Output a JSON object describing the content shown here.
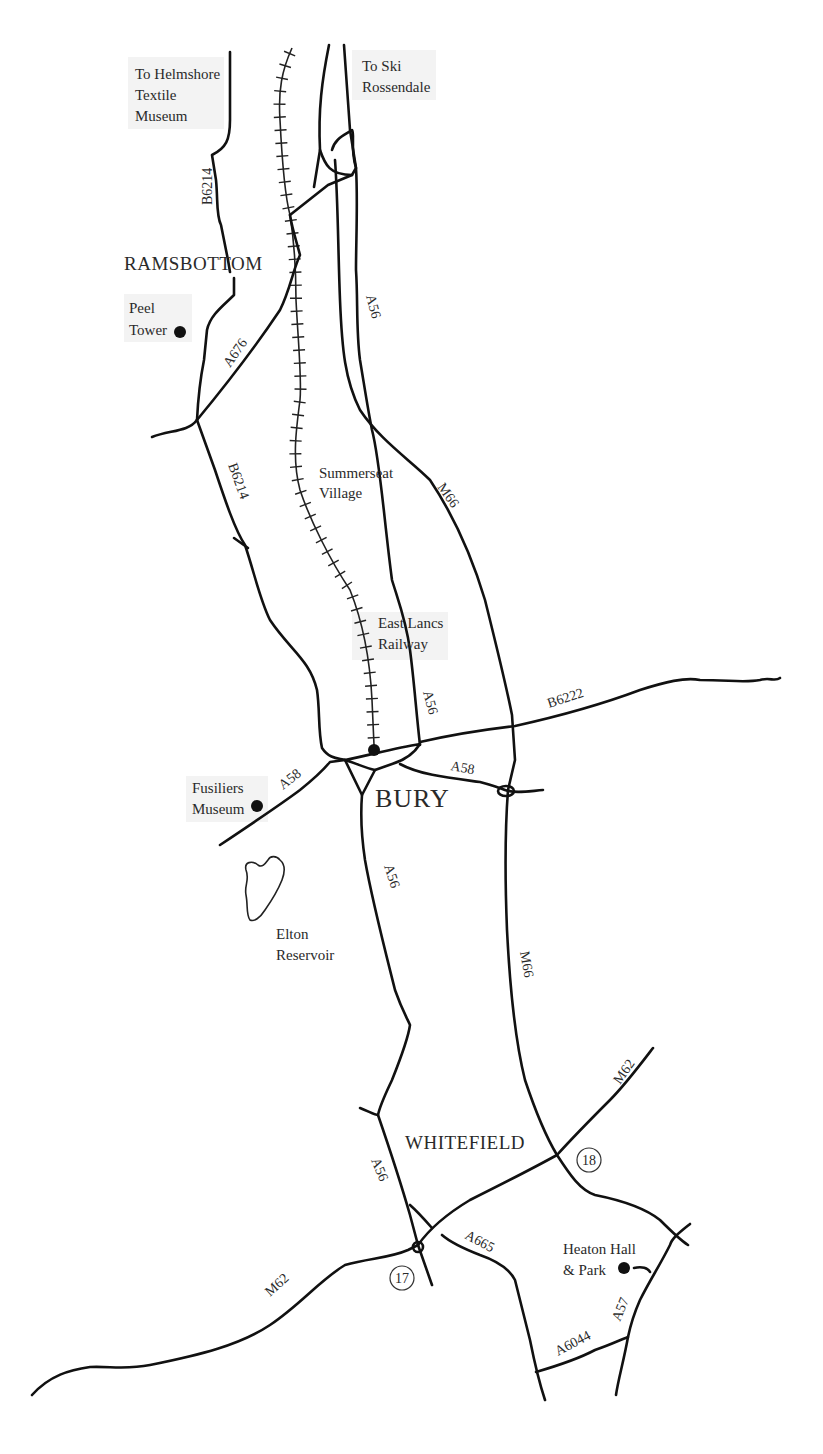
{
  "map": {
    "background": "#ffffff",
    "road_color": "#111111",
    "towns": [
      {
        "id": "ramsbottom",
        "name": "RAMSBOTTOM"
      },
      {
        "id": "bury",
        "name": "BURY"
      },
      {
        "id": "whitefield",
        "name": "WHITEFIELD"
      }
    ],
    "places": {
      "helmshore": [
        "To Helmshore",
        "Textile",
        "Museum"
      ],
      "ski": [
        "To Ski",
        "Rossendale"
      ],
      "peel": [
        "Peel",
        "Tower"
      ],
      "summerseat": [
        "Summerseat",
        "Village"
      ],
      "eastlancs": [
        "East Lancs",
        "Railway"
      ],
      "fusiliers": [
        "Fusiliers",
        "Museum"
      ],
      "elton": [
        "Elton",
        "Reservoir"
      ],
      "heaton": [
        "Heaton Hall",
        "& Park"
      ]
    },
    "roads": {
      "b6214_north": "B6214",
      "a56_north": "A56",
      "a676": "A676",
      "b6214_south": "B6214",
      "m66_north": "M66",
      "a56_bury": "A56",
      "b6222": "B6222",
      "a58_west": "A58",
      "a58_east": "A58",
      "a56_south": "A56",
      "m66_south": "M66",
      "m62_east": "M62",
      "a56_whitefield": "A56",
      "a665": "A665",
      "m62_west": "M62",
      "a57": "A57",
      "a6044": "A6044"
    },
    "junctions": {
      "j17": "17",
      "j18": "18"
    }
  }
}
